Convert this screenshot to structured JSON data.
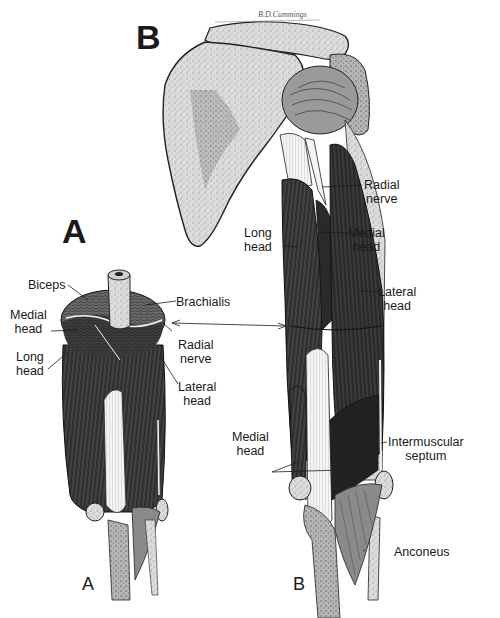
{
  "figure": {
    "signature": "B.D.Cummings",
    "panels": [
      {
        "id": "A",
        "title_large": "A",
        "title_small": "A",
        "view": "cross-section of arm",
        "labels": [
          {
            "text": "Biceps"
          },
          {
            "text": "Brachialis"
          },
          {
            "text": "Medial\nhead"
          },
          {
            "text": "Radial\nnerve"
          },
          {
            "text": "Long\nhead"
          },
          {
            "text": "Lateral\nhead"
          }
        ]
      },
      {
        "id": "B",
        "title_large": "B",
        "title_small": "B",
        "view": "posterior view of shoulder and arm",
        "labels": [
          {
            "text": "Radial\nnerve"
          },
          {
            "text": "Long\nhead"
          },
          {
            "text": "Medial\nhead"
          },
          {
            "text": "Lateral\nhead"
          },
          {
            "text": "Medial\nhead"
          },
          {
            "text": "Intermuscular\nseptum"
          },
          {
            "text": "Anconeus"
          }
        ]
      }
    ]
  },
  "colors": {
    "muscle": "#3a3a3a",
    "muscle_dark": "#262626",
    "bone": "#d8d8d8",
    "bone_shade": "#a8a8a8",
    "tendon": "#f2f2f2",
    "ink": "#1a1a1a",
    "background": "#ffffff"
  }
}
